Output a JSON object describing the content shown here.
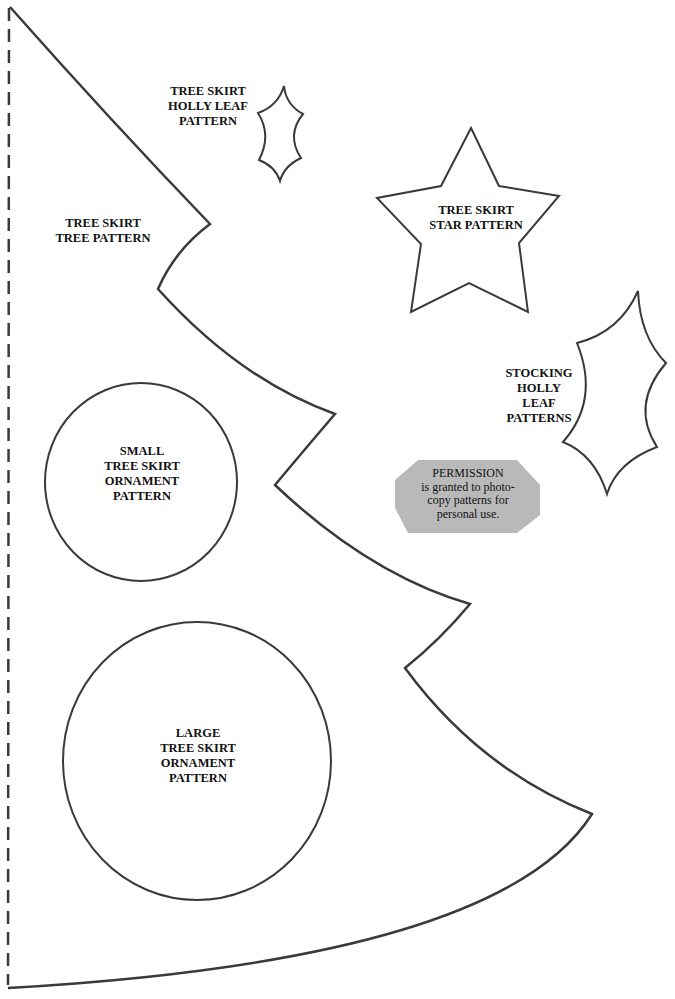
{
  "page": {
    "colors": {
      "background": "#ffffff",
      "outline": "#3a3a3a",
      "text": "#111111",
      "permission_fill": "#b9b9b9"
    }
  },
  "patterns": {
    "tree": {
      "lines": [
        "TREE SKIRT",
        "TREE PATTERN"
      ]
    },
    "holly_small": {
      "lines": [
        "TREE SKIRT",
        "HOLLY LEAF",
        "PATTERN"
      ]
    },
    "star": {
      "lines": [
        "TREE SKIRT",
        "STAR PATTERN"
      ]
    },
    "stocking_holly": {
      "lines": [
        "STOCKING",
        "HOLLY",
        "LEAF",
        "PATTERNS"
      ]
    },
    "small_ornament": {
      "lines": [
        "SMALL",
        "TREE SKIRT",
        "ORNAMENT",
        "PATTERN"
      ]
    },
    "large_ornament": {
      "lines": [
        "LARGE",
        "TREE SKIRT",
        "ORNAMENT",
        "PATTERN"
      ]
    }
  },
  "permission": {
    "lines": [
      "PERMISSION",
      "is granted to photo-",
      "copy patterns for",
      "personal use."
    ]
  }
}
